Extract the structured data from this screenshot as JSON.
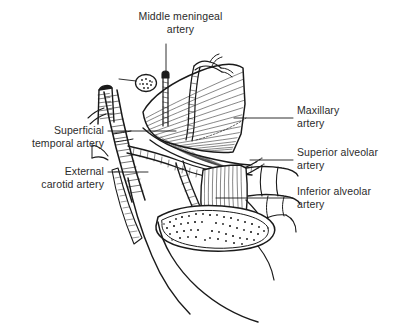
{
  "figure": {
    "type": "anatomical-line-drawing",
    "background_color": "#ffffff",
    "ink_color": "#1a1a1a",
    "text_color": "#2b2b2b"
  },
  "labels": [
    {
      "id": "middle-meningeal-artery",
      "line1": "Middle meningeal",
      "line2": "artery",
      "align": "center",
      "x": 128,
      "y": 10,
      "width": 105
    },
    {
      "id": "superficial-temporal-artery",
      "line1": "Superficial",
      "line2": "temporal artery",
      "align": "right",
      "x": 14,
      "y": 124,
      "width": 90
    },
    {
      "id": "external-carotid-artery",
      "line1": "External",
      "line2": "carotid artery",
      "align": "right",
      "x": 14,
      "y": 165,
      "width": 90
    },
    {
      "id": "maxillary-artery",
      "line1": "Maxillary",
      "line2": "artery",
      "align": "left",
      "x": 297,
      "y": 104,
      "width": 95
    },
    {
      "id": "superior-alveolar-artery",
      "line1": "Superior alveolar",
      "line2": "artery",
      "align": "left",
      "x": 297,
      "y": 146,
      "width": 95
    },
    {
      "id": "inferior-alveolar-artery",
      "line1": "Inferior alveolar",
      "line2": "artery",
      "align": "left",
      "x": 297,
      "y": 185,
      "width": 95
    }
  ],
  "structures": [
    {
      "id": "temporalis-muscle",
      "kind": "muscle-fan"
    },
    {
      "id": "lateral-pterygoid-muscle",
      "kind": "muscle-block"
    },
    {
      "id": "mandible-cut-section",
      "kind": "bone-cancellous"
    },
    {
      "id": "maxilla-teeth",
      "kind": "bone-outline"
    },
    {
      "id": "external-carotid-trunk",
      "kind": "vessel-hatched"
    },
    {
      "id": "middle-meningeal-vessel",
      "kind": "vessel-hatched"
    },
    {
      "id": "maxillary-vessel",
      "kind": "vessel-hatched"
    },
    {
      "id": "superior-alveolar-vessel",
      "kind": "vessel-hatched"
    },
    {
      "id": "inferior-alveolar-vessel",
      "kind": "vessel-hatched"
    },
    {
      "id": "nerve-oval-cut",
      "kind": "stippled-oval"
    }
  ]
}
